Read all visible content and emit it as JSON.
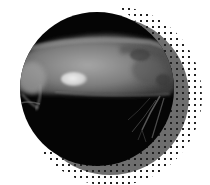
{
  "image": {
    "subject": "X-ray radiograph of a small rodent (guinea pig) in lateral view showing a bladder stone",
    "alt": "Circular cropped X-ray of a guinea pig with a bright oval bladder stone",
    "colors": {
      "background": "#ffffff",
      "xray_circle": "#050505",
      "shadow_circle": "#6e6e6e",
      "halftone_dots": "#222222",
      "body_tissue": "#8a8a8a",
      "stone": "#d9d9d9"
    },
    "elements": [
      "xray-circle",
      "shadow-circle",
      "halftone-dot-pattern",
      "bladder-stone"
    ]
  }
}
